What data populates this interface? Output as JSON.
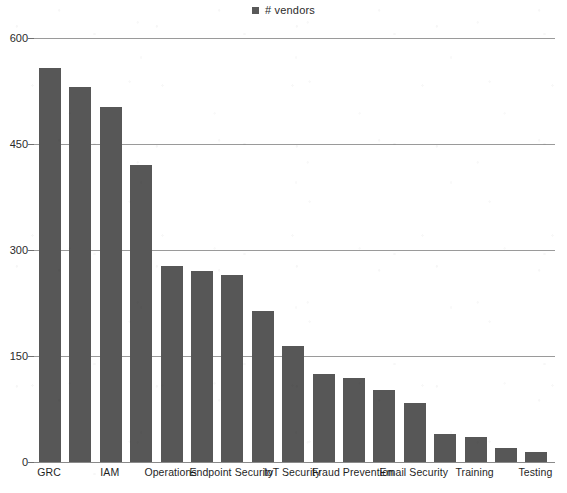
{
  "legend": {
    "marker_name": "legend-swatch",
    "label": "# vendors",
    "color": "#595959"
  },
  "axis": {
    "y_ticks": [
      "0",
      "150",
      "300",
      "450",
      "600"
    ]
  },
  "caption": "",
  "chart_data": {
    "type": "bar",
    "title": "",
    "subtitle": "",
    "xlabel": "",
    "ylabel": "",
    "ylim": [
      0,
      600
    ],
    "ytick_values": [
      0,
      150,
      300,
      450,
      600
    ],
    "grid": true,
    "legend_position": "top-center",
    "series_name": "# vendors",
    "bar_color": "#575757",
    "categories": [
      "GRC",
      "",
      "IAM",
      "",
      "Operations",
      "",
      "Endpoint Security",
      "",
      "IoT Security",
      "",
      "Fraud Prevention",
      "",
      "Email Security",
      "",
      "Training",
      "",
      "Testing"
    ],
    "visible_tick_labels": [
      "GRC",
      "IAM",
      "Operations",
      "Endpoint Security",
      "IoT Security",
      "Fraud Prevention",
      "Email Security",
      "Training",
      "Testing"
    ],
    "values": [
      557,
      530,
      503,
      420,
      277,
      270,
      265,
      213,
      164,
      124,
      119,
      102,
      84,
      40,
      36,
      20,
      14
    ]
  }
}
